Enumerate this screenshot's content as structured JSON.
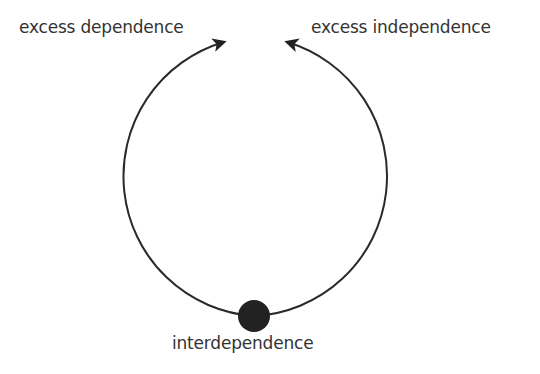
{
  "diagram": {
    "type": "cycle",
    "labels": {
      "top_left": "excess dependence",
      "top_right": "excess independence",
      "bottom": "interdependence"
    },
    "colors": {
      "stroke": "#2a2a2a",
      "dot": "#222222",
      "text": "#333333",
      "background": "#ffffff"
    }
  }
}
